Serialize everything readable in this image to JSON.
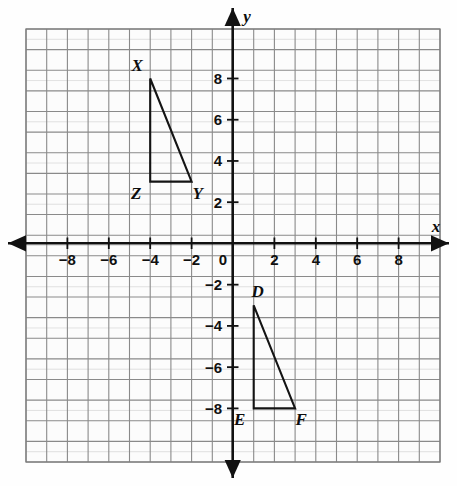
{
  "figure": {
    "background_color": "#fefefe",
    "grid_color": "#8a8a8a",
    "minor_grid_color": "#c9c9c9",
    "axis_color": "#111111",
    "shape_color": "#141414"
  },
  "axes": {
    "x_label": "x",
    "y_label": "y",
    "x_ticks": [
      "-8",
      "-6",
      "-4",
      "-2",
      "0",
      "2",
      "4",
      "6",
      "8"
    ],
    "x_tick_values": [
      -8,
      -6,
      -4,
      -2,
      0,
      2,
      4,
      6,
      8
    ],
    "y_ticks": [
      "8",
      "6",
      "4",
      "2",
      "0",
      "-2",
      "-4",
      "-6",
      "-8"
    ],
    "y_tick_values": [
      8,
      6,
      4,
      2,
      0,
      -2,
      -4,
      -6,
      -8
    ],
    "x_range": [
      -10,
      10
    ],
    "y_range": [
      -10,
      11
    ],
    "grid": true,
    "arrowheads": [
      "left",
      "right",
      "up",
      "down"
    ]
  },
  "chart_data": {
    "type": "scatter",
    "title": "",
    "xlabel": "x",
    "ylabel": "y",
    "xlim": [
      -10,
      10
    ],
    "ylim": [
      -10,
      11
    ],
    "grid": true,
    "legend": "none",
    "shapes": [
      {
        "name": "triangle-xyz",
        "closed": true,
        "vertices": [
          {
            "label": "X",
            "x": -4,
            "y": 8,
            "label_pos": "above-left"
          },
          {
            "label": "Y",
            "x": -2,
            "y": 3,
            "label_pos": "below-right"
          },
          {
            "label": "Z",
            "x": -4,
            "y": 3,
            "label_pos": "below-left"
          }
        ]
      },
      {
        "name": "triangle-def",
        "closed": true,
        "vertices": [
          {
            "label": "D",
            "x": 1,
            "y": -3,
            "label_pos": "above-right"
          },
          {
            "label": "F",
            "x": 3,
            "y": -8,
            "label_pos": "below-right"
          },
          {
            "label": "E",
            "x": 1,
            "y": -8,
            "label_pos": "below-left"
          }
        ]
      }
    ]
  }
}
